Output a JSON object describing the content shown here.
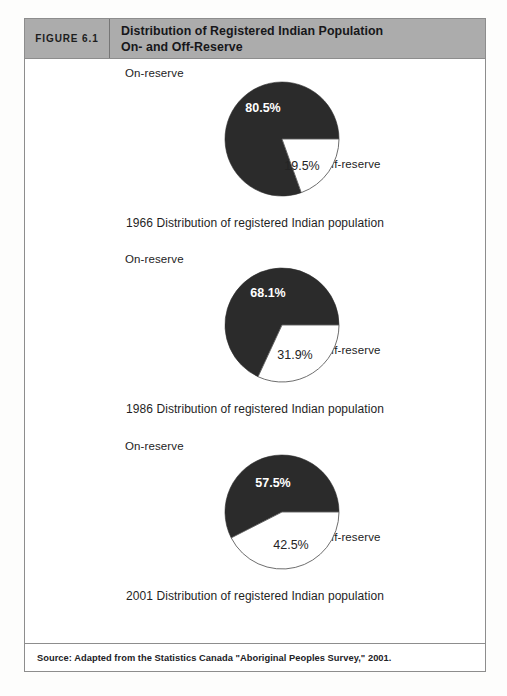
{
  "figure": {
    "number_label": "FIGURE 6.1",
    "title_line1": "Distribution of Registered Indian Population",
    "title_line2": "On- and Off-Reserve",
    "source": "Source: Adapted from the Statistics Canada \"Aboriginal Peoples Survey,\" 2001.",
    "header_bg": "#acacac",
    "border_color": "#8d8d8d"
  },
  "charts": [
    {
      "caption": "1966 Distribution of registered Indian population",
      "on_label": "On-reserve",
      "off_label": "Off-reserve",
      "on_pct_text": "80.5%",
      "off_pct_text": "19.5%"
    },
    {
      "caption": "1986 Distribution of registered Indian population",
      "on_label": "On-reserve",
      "off_label": "Off-reserve",
      "on_pct_text": "68.1%",
      "off_pct_text": "31.9%"
    },
    {
      "caption": "2001 Distribution of registered Indian population",
      "on_label": "On-reserve",
      "off_label": "Off-reserve",
      "on_pct_text": "57.5%",
      "off_pct_text": "42.5%"
    }
  ],
  "chart_data": [
    {
      "type": "pie",
      "title": "1966 Distribution of registered Indian population",
      "labels": [
        "On-reserve",
        "Off-reserve"
      ],
      "values": [
        80.5,
        19.5
      ],
      "colors": [
        "#2b2b2b",
        "#ffffff"
      ],
      "units": "percent",
      "start_angle_deg": 0,
      "direction": "clockwise",
      "legend": "labels placed outside slices",
      "data_labels": [
        "80.5%",
        "19.5%"
      ]
    },
    {
      "type": "pie",
      "title": "1986 Distribution of registered Indian population",
      "labels": [
        "On-reserve",
        "Off-reserve"
      ],
      "values": [
        68.1,
        31.9
      ],
      "colors": [
        "#2b2b2b",
        "#ffffff"
      ],
      "units": "percent",
      "start_angle_deg": 0,
      "direction": "clockwise",
      "legend": "labels placed outside slices",
      "data_labels": [
        "68.1%",
        "31.9%"
      ]
    },
    {
      "type": "pie",
      "title": "2001 Distribution of registered Indian population",
      "labels": [
        "On-reserve",
        "Off-reserve"
      ],
      "values": [
        57.5,
        42.5
      ],
      "colors": [
        "#2b2b2b",
        "#ffffff"
      ],
      "units": "percent",
      "start_angle_deg": 0,
      "direction": "clockwise",
      "legend": "labels placed outside slices",
      "data_labels": [
        "57.5%",
        "42.5%"
      ]
    }
  ]
}
